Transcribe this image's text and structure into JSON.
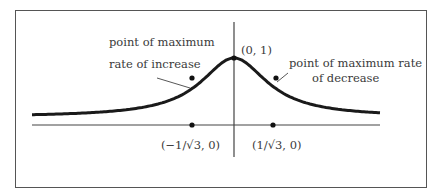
{
  "figure": {
    "type": "curve-diagram",
    "function_shape": "bell-shaped curve y = 1/(1+3x^2)",
    "labels": {
      "max_increase_line1": "point of maximum",
      "max_increase_line2": "rate of increase",
      "max_decrease_line1": "point of maximum rate",
      "max_decrease_line2": "of decrease",
      "peak": "(0, 1)",
      "left_point": "(−1/√3, 0)",
      "right_point": "(1/√3, 0)"
    },
    "points": [
      {
        "name": "peak",
        "x": 0,
        "y": 1
      },
      {
        "name": "inflection-left",
        "x": "-1/√3"
      },
      {
        "name": "inflection-right",
        "x": "1/√3"
      },
      {
        "name": "axis-left",
        "x": "-1/√3",
        "y": 0
      },
      {
        "name": "axis-right",
        "x": "1/√3",
        "y": 0
      }
    ]
  }
}
